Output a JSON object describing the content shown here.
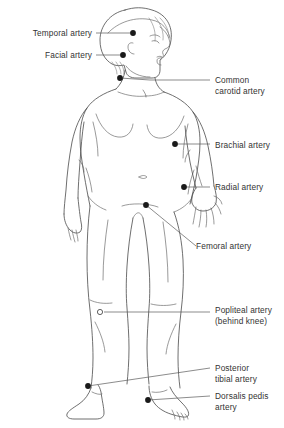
{
  "diagram": {
    "background_color": "#ffffff",
    "outline_color": "#4a4a4a",
    "text_color": "#333333",
    "leader_color": "#5a5a5a",
    "marker_color": "#1a1a1a"
  },
  "labels": [
    {
      "id": "temporal-artery",
      "text": "Temporal artery",
      "side": "left",
      "x": 8,
      "y": 28,
      "width": 84,
      "marker": {
        "x": 133,
        "y": 33,
        "type": "dot"
      },
      "leader": "M 96,33 L 133,33"
    },
    {
      "id": "facial-artery",
      "text": "Facial artery",
      "side": "left",
      "x": 8,
      "y": 50,
      "width": 84,
      "marker": {
        "x": 123,
        "y": 55,
        "type": "dot"
      },
      "leader": "M 96,55 L 123,55"
    },
    {
      "id": "common-carotid-artery",
      "text": "Common\ncarotid artery",
      "side": "right",
      "x": 215,
      "y": 75,
      "width": 68,
      "marker": {
        "x": 120,
        "y": 78,
        "type": "dot"
      },
      "leader": "M 210,80 L 150,80 L 120,78"
    },
    {
      "id": "brachial-artery",
      "text": "Brachial artery",
      "side": "right",
      "x": 215,
      "y": 140,
      "width": 68,
      "marker": {
        "x": 175,
        "y": 144,
        "type": "dot"
      },
      "leader": "M 210,144 L 175,144"
    },
    {
      "id": "radial-artery",
      "text": "Radial artery",
      "side": "right",
      "x": 215,
      "y": 182,
      "width": 68,
      "marker": {
        "x": 184,
        "y": 187,
        "type": "dot"
      },
      "leader": "M 210,187 L 184,187"
    },
    {
      "id": "femoral-artery",
      "text": "Femoral artery",
      "side": "right",
      "x": 196,
      "y": 241,
      "width": 86,
      "marker": {
        "x": 146,
        "y": 205,
        "type": "dot"
      },
      "leader": "M 196,246 L 146,205"
    },
    {
      "id": "popliteal-artery",
      "text": "Popliteal artery\n(behind knee)",
      "side": "right",
      "x": 215,
      "y": 305,
      "width": 68,
      "marker": {
        "x": 100,
        "y": 312,
        "type": "ring"
      },
      "leader": "M 210,312 L 104,312"
    },
    {
      "id": "posterior-tibial-artery",
      "text": "Posterior\ntibial artery",
      "side": "right",
      "x": 215,
      "y": 363,
      "width": 68,
      "marker": {
        "x": 88,
        "y": 386,
        "type": "dot"
      },
      "leader": "M 210,368 L 88,386"
    },
    {
      "id": "dorsalis-pedis-artery",
      "text": "Dorsalis pedis\nartery",
      "side": "right",
      "x": 215,
      "y": 391,
      "width": 68,
      "marker": {
        "x": 148,
        "y": 400,
        "type": "dot"
      },
      "leader": "M 210,396 L 148,400"
    }
  ]
}
